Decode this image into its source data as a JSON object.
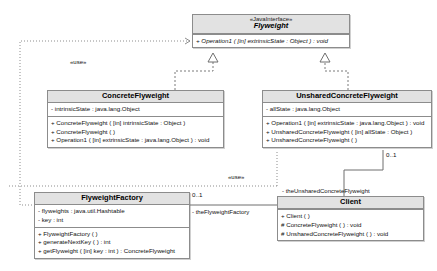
{
  "diagram": {
    "type": "uml-class-diagram",
    "colors": {
      "header_fill": "#e2e2e2",
      "body_fill": "#ffffff",
      "border": "#8c8c8c",
      "line": "#7a7a7a",
      "text": "#111111"
    }
  },
  "classes": {
    "flyweight": {
      "stereotype": "«JavaInterface»",
      "name": "Flyweight",
      "attributes": [],
      "operations": [
        "+ Operation1 ( [in] extrinsicState : Object ) : void"
      ]
    },
    "concrete_flyweight": {
      "stereotype": "",
      "name": "ConcreteFlyweight",
      "attributes": [
        "- intrinsicState : java.lang.Object"
      ],
      "operations": [
        "+ ConcreteFlyweight ( [in] intrinsicState : Object )",
        "+ ConcreteFlyweight ( )",
        "+ Operation1 ( [in] extrinsicState : java.lang.Object ) : void"
      ]
    },
    "unshared_concrete_flyweight": {
      "stereotype": "",
      "name": "UnsharedConcreteFlyweight",
      "attributes": [
        "- allState : java.lang.Object"
      ],
      "operations": [
        "+ Operation1 ( [in] extrinsicState : java.lang.Object ) : void",
        "+ UnsharedConcreteFlyweight ( [in] allState : Object )",
        "+ UnsharedConcreteFlyweight ( )"
      ]
    },
    "flyweight_factory": {
      "stereotype": "",
      "name": "FlyweightFactory",
      "attributes": [
        "- flyweights : java.util.Hashtable",
        "- key : int"
      ],
      "operations": [
        "+ FlyweightFactory ( )",
        "+ generateNextKey ( ) : int",
        "+ getFlyweight ( [in] key : int ) : ConcreteFlyweight"
      ]
    },
    "client": {
      "stereotype": "",
      "name": "Client",
      "attributes": [],
      "operations": [
        "+ Client ( )",
        "# ConcreteFlyweight ( ) : void",
        "# UnsharedConcreteFlyweight ( ) : void"
      ]
    }
  },
  "relationships": {
    "use_factory_to_flyweight": {
      "label": "«use»"
    },
    "use_client_to_flyweight": {
      "label": "«use»"
    },
    "factory_role": {
      "multiplicity": "0..1",
      "role": "- theFlyweightFactory"
    },
    "unshared_role": {
      "multiplicity": "0..1",
      "role": "- theUnsharedConcreteFlyweight"
    }
  }
}
